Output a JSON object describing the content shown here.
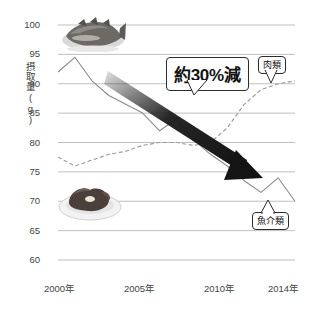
{
  "chart_data": {
    "type": "line",
    "title": "",
    "xlabel": "",
    "ylabel": "摂取量(g)",
    "ylim": [
      60,
      100
    ],
    "xlim": [
      2000,
      2014
    ],
    "ytick_labels": [
      "100",
      "95",
      "90",
      "85",
      "80",
      "75",
      "70",
      "65",
      "60"
    ],
    "ytick_values": [
      100,
      95,
      90,
      85,
      80,
      75,
      70,
      65,
      60
    ],
    "xtick_labels": [
      "2000年",
      "2005年",
      "2010年",
      "2014年"
    ],
    "xtick_values": [
      2000,
      2005,
      2010,
      2014
    ],
    "grid": true,
    "legend_position": "inline-labels",
    "x": [
      2000,
      2001,
      2002,
      2003,
      2004,
      2005,
      2006,
      2007,
      2008,
      2009,
      2010,
      2011,
      2012,
      2013,
      2014
    ],
    "series": [
      {
        "name": "魚介類",
        "style": "solid",
        "color": "#8a8a8a",
        "values": [
          92.0,
          94.5,
          90.5,
          88.0,
          86.5,
          85.0,
          82.0,
          84.0,
          80.5,
          78.0,
          76.0,
          73.5,
          71.5,
          74.0,
          70.0
        ]
      },
      {
        "name": "肉類",
        "style": "dashed",
        "color": "#9a9a9a",
        "values": [
          77.5,
          76.0,
          77.0,
          78.0,
          78.5,
          79.5,
          80.0,
          80.0,
          79.5,
          80.0,
          82.5,
          86.5,
          89.0,
          90.0,
          90.5
        ]
      }
    ],
    "annotations": [
      {
        "name": "decline-arrow",
        "text": "約30%減",
        "kind": "callout-arrow"
      }
    ]
  },
  "axis": {
    "y_title": "摂取量(g)"
  },
  "labels": {
    "meat": "肉類",
    "fish": "魚介類",
    "decline": "約30%減"
  },
  "images": {
    "fish_icon": "grilled-fish-photo",
    "meat_icon": "meat-dish-photo"
  },
  "colors": {
    "gridline": "#b9b9b9",
    "fish_line": "#8a8a8a",
    "meat_line": "#9a9a9a",
    "arrow": "#1c1c1c",
    "text": "#333333"
  }
}
